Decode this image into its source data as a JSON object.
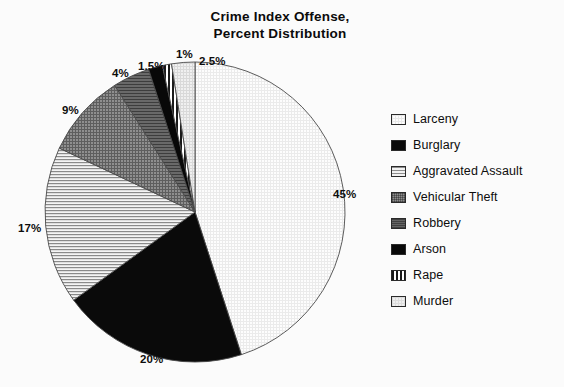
{
  "title": {
    "line1": "Crime Index Offense,",
    "line2": "Percent Distribution"
  },
  "chart_data": {
    "type": "pie",
    "title": "Crime Index Offense, Percent Distribution",
    "xlabel": "",
    "ylabel": "",
    "units": "percent",
    "legend_position": "right",
    "grid": false,
    "start_angle_deg": 0,
    "direction": "clockwise",
    "categories": [
      "Larceny",
      "Burglary",
      "Aggravated Assault",
      "Vehicular Theft",
      "Robbery",
      "Arson",
      "Rape",
      "Murder"
    ],
    "values": [
      45,
      20,
      17,
      9,
      4,
      1.5,
      1,
      2.5
    ],
    "labels": [
      "45%",
      "20%",
      "17%",
      "9%",
      "4%",
      "1.5%",
      "1%",
      "2.5%"
    ],
    "slices": [
      {
        "name": "Larceny",
        "value": 45,
        "label": "45%",
        "fill": "light-dotted-grid",
        "color": "#fdfdfd"
      },
      {
        "name": "Burglary",
        "value": 20,
        "label": "20%",
        "fill": "solid-black",
        "color": "#0a0a0a"
      },
      {
        "name": "Aggravated Assault",
        "value": 17,
        "label": "17%",
        "fill": "horizontal-lines",
        "color": "#f2f2f2"
      },
      {
        "name": "Vehicular Theft",
        "value": 9,
        "label": "9%",
        "fill": "gray-crosshatch",
        "color": "#8d8d8d"
      },
      {
        "name": "Robbery",
        "value": 4,
        "label": "4%",
        "fill": "dark-gray",
        "color": "#646464"
      },
      {
        "name": "Arson",
        "value": 1.5,
        "label": "1.5%",
        "fill": "solid-black",
        "color": "#080808"
      },
      {
        "name": "Rape",
        "value": 1,
        "label": "1%",
        "fill": "vertical-stripes",
        "color": "#1a1a1a"
      },
      {
        "name": "Murder",
        "value": 2.5,
        "label": "2.5%",
        "fill": "very-light-grid",
        "color": "#eeeeee"
      }
    ]
  },
  "slice_labels": [
    {
      "text": "45%",
      "x": 333,
      "y": 188
    },
    {
      "text": "20%",
      "x": 140,
      "y": 353
    },
    {
      "text": "17%",
      "x": 18,
      "y": 222
    },
    {
      "text": "9%",
      "x": 62,
      "y": 104
    },
    {
      "text": "4%",
      "x": 112,
      "y": 67
    },
    {
      "text": "1.5%",
      "x": 138,
      "y": 60
    },
    {
      "text": "1%",
      "x": 176,
      "y": 48
    },
    {
      "text": "2.5%",
      "x": 199,
      "y": 55
    }
  ],
  "legend": {
    "items": [
      {
        "label": "Larceny",
        "swatch": "larceny"
      },
      {
        "label": "Burglary",
        "swatch": "burglary"
      },
      {
        "label": "Aggravated Assault",
        "swatch": "aggravated-assault"
      },
      {
        "label": "Vehicular Theft",
        "swatch": "vehicular-theft"
      },
      {
        "label": "Robbery",
        "swatch": "robbery"
      },
      {
        "label": "Arson",
        "swatch": "arson"
      },
      {
        "label": "Rape",
        "swatch": "rape"
      },
      {
        "label": "Murder",
        "swatch": "murder"
      }
    ]
  },
  "colors": {
    "background": "#fbfbfb",
    "text": "#0d0d0d",
    "outline": "#4a4a4a"
  }
}
